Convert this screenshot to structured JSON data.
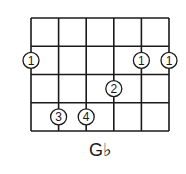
{
  "chord": {
    "name": "G♭"
  },
  "diagram": {
    "strings": 6,
    "frets": 4,
    "line_color": "#1a1a1a",
    "fingers": [
      {
        "string": 1,
        "fret": 2,
        "finger": "1"
      },
      {
        "string": 5,
        "fret": 2,
        "finger": "1"
      },
      {
        "string": 6,
        "fret": 2,
        "finger": "1"
      },
      {
        "string": 4,
        "fret": 3,
        "finger": "2"
      },
      {
        "string": 2,
        "fret": 4,
        "finger": "3"
      },
      {
        "string": 3,
        "fret": 4,
        "finger": "4"
      }
    ]
  }
}
